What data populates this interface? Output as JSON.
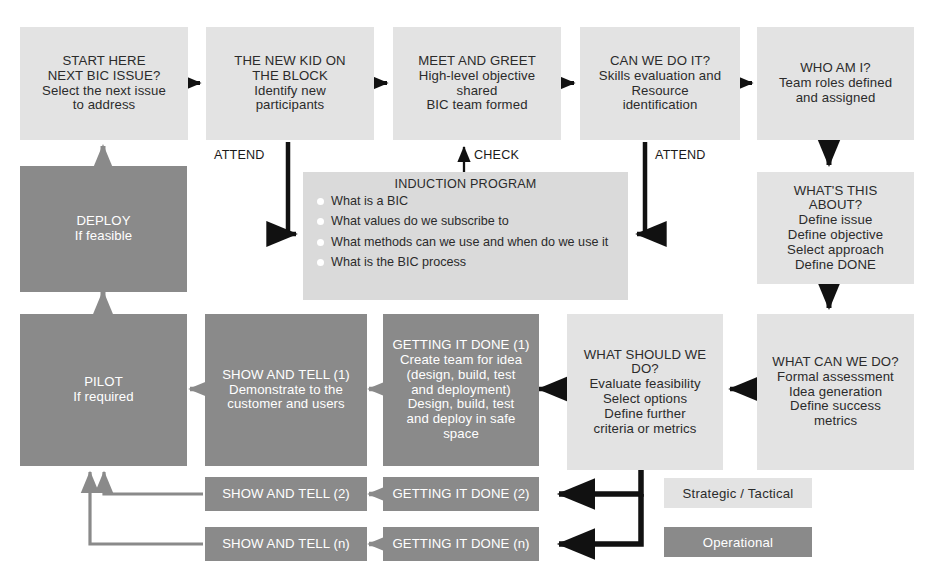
{
  "diagram": {
    "colors": {
      "strategic_fill": "#e3e3e3",
      "operational_fill": "#8a8a8a",
      "strategic_text": "#2b2b2b",
      "operational_text": "#ffffff",
      "arrow_dark": "#111111",
      "arrow_gray": "#8a8a8a",
      "induction_fill": "#dadada",
      "background": "#ffffff"
    },
    "nodes": {
      "start_here": {
        "lines": [
          "START HERE",
          "NEXT BIC ISSUE?",
          "Select the next issue",
          "to address"
        ],
        "type": "strategic"
      },
      "new_kid": {
        "lines": [
          "THE NEW KID ON",
          "THE BLOCK",
          "Identify new",
          "participants"
        ],
        "type": "strategic"
      },
      "meet_greet": {
        "lines": [
          "MEET AND GREET",
          "High-level objective",
          "shared",
          "BIC team formed"
        ],
        "type": "strategic"
      },
      "can_we_do_it": {
        "lines": [
          "CAN WE DO IT?",
          "Skills evaluation and",
          "Resource",
          "identification"
        ],
        "type": "strategic"
      },
      "who_am_i": {
        "lines": [
          "WHO AM I?",
          "Team roles defined",
          "and assigned"
        ],
        "type": "strategic"
      },
      "whats_this_about": {
        "lines": [
          "WHAT'S THIS",
          "ABOUT?",
          "Define issue",
          "Define objective",
          "Select approach",
          "Define DONE"
        ],
        "type": "strategic"
      },
      "what_can_we_do": {
        "lines": [
          "WHAT CAN WE DO?",
          "Formal assessment",
          "Idea generation",
          "Define success",
          "metrics"
        ],
        "type": "strategic"
      },
      "what_should_we_do": {
        "lines": [
          "WHAT SHOULD WE",
          "DO?",
          "Evaluate feasibility",
          "Select options",
          "Define further",
          "criteria or metrics"
        ],
        "type": "strategic"
      },
      "getting_it_done_1": {
        "lines": [
          "GETTING IT DONE (1)",
          "Create team for idea",
          "(design, build, test",
          "and deployment)",
          "Design, build, test",
          "and deploy in safe",
          "space"
        ],
        "type": "operational"
      },
      "show_and_tell_1": {
        "lines": [
          "SHOW AND TELL (1)",
          "Demonstrate to the",
          "customer and users"
        ],
        "type": "operational"
      },
      "getting_it_done_2": {
        "lines": [
          "GETTING IT DONE (2)"
        ],
        "type": "operational"
      },
      "show_and_tell_2": {
        "lines": [
          "SHOW AND TELL (2)"
        ],
        "type": "operational"
      },
      "getting_it_done_n": {
        "lines": [
          "GETTING IT DONE (n)"
        ],
        "type": "operational"
      },
      "show_and_tell_n": {
        "lines": [
          "SHOW AND TELL (n)"
        ],
        "type": "operational"
      },
      "pilot": {
        "lines": [
          "PILOT",
          "If required"
        ],
        "type": "operational"
      },
      "deploy": {
        "lines": [
          "DEPLOY",
          "If feasible"
        ],
        "type": "operational"
      }
    },
    "induction": {
      "title": "INDUCTION PROGRAM",
      "items": [
        "What is a BIC",
        "What values do we subscribe to",
        "What methods can we use and when do we use it",
        "What is the BIC process"
      ]
    },
    "edge_labels": {
      "attend_left": "ATTEND",
      "check": "CHECK",
      "attend_right": "ATTEND"
    },
    "legend": {
      "strategic_label": "Strategic / Tactical",
      "operational_label": "Operational"
    }
  }
}
